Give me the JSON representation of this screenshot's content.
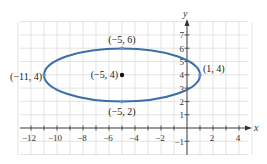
{
  "chart_data": {
    "type": "line",
    "title": "",
    "xlabel": "x",
    "ylabel": "y",
    "xlim": [
      -13,
      5
    ],
    "ylim": [
      -2,
      8
    ],
    "grid": true,
    "x_ticks": [
      -12,
      -10,
      -8,
      -6,
      -4,
      -2,
      2,
      4
    ],
    "y_ticks": [
      -1,
      1,
      2,
      3,
      4,
      5,
      6,
      7
    ],
    "series": [
      {
        "name": "ellipse",
        "shape": "ellipse",
        "center": [
          -5,
          4
        ],
        "semi_major_x": 6,
        "semi_minor_y": 2,
        "color": "#3a6fa8"
      }
    ],
    "points": [
      {
        "label": "(-5, 6)",
        "x": -5,
        "y": 6,
        "kind": "vertex-on-curve"
      },
      {
        "label": "(-11, 4)",
        "x": -11,
        "y": 4,
        "kind": "vertex-on-curve"
      },
      {
        "label": "(1, 4)",
        "x": 1,
        "y": 4,
        "kind": "vertex-on-curve"
      },
      {
        "label": "(-5, 2)",
        "x": -5,
        "y": 2,
        "kind": "vertex-on-curve"
      },
      {
        "label": "(-5, 4)",
        "x": -5,
        "y": 4,
        "kind": "center"
      }
    ]
  },
  "labels": {
    "top": "(−5, 6)",
    "left": "(−11, 4)",
    "right": "(1, 4)",
    "bottom": "(−5, 2)",
    "center": "(−5, 4)",
    "x_axis": "x",
    "y_axis": "y"
  },
  "ticks": {
    "x": [
      "−12",
      "−10",
      "−8",
      "−6",
      "−4",
      "−2",
      "2",
      "4"
    ],
    "y": [
      "−1",
      "1",
      "2",
      "3",
      "4",
      "5",
      "6",
      "7"
    ]
  }
}
